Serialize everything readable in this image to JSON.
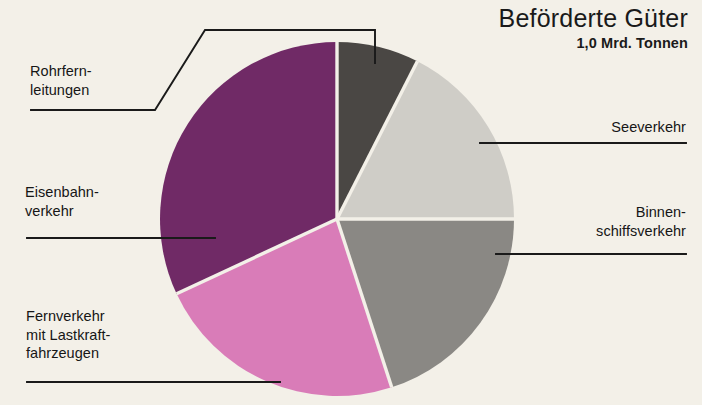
{
  "header": {
    "title": "Beförderte Güter",
    "subtitle": "1,0 Mrd. Tonnen"
  },
  "labels": {
    "rohrfernleitungen": {
      "line1": "Rohrfern-",
      "line2": "leitungen"
    },
    "eisenbahnverkehr": {
      "line1": "Eisenbahn-",
      "line2": "verkehr"
    },
    "fernverkehr": {
      "line1": "Fernverkehr",
      "line2": "mit Lastkraft-",
      "line3": "fahrzeugen"
    },
    "seeverkehr": {
      "line1": "Seeverkehr"
    },
    "binnenschiffsverkehr": {
      "line1": "Binnen-",
      "line2": "schiffsverkehr"
    }
  },
  "chart_data": {
    "type": "pie",
    "title": "Beförderte Güter",
    "subtitle": "1,0 Mrd. Tonnen",
    "unit": "Mrd. Tonnen",
    "total": 1.0,
    "legend_position": "callouts",
    "grid": false,
    "categories": [
      "Rohrfernleitungen",
      "Seeverkehr",
      "Binnenschiffsverkehr",
      "Fernverkehr mit Lastkraftfahrzeugen",
      "Eisenbahnverkehr"
    ],
    "values": [
      7.5,
      17.5,
      20.0,
      23.0,
      32.0
    ],
    "value_unit": "percent",
    "slices": [
      {
        "name": "Rohrfernleitungen",
        "percent": 7.5,
        "start_angle": 0,
        "end_angle": 27,
        "color": "#4a4744"
      },
      {
        "name": "Seeverkehr",
        "percent": 17.5,
        "start_angle": 27,
        "end_angle": 90,
        "color": "#cfcdc7"
      },
      {
        "name": "Binnenschiffsverkehr",
        "percent": 20.0,
        "start_angle": 90,
        "end_angle": 162,
        "color": "#8a8884"
      },
      {
        "name": "Fernverkehr mit Lastkraftfahrzeugen",
        "percent": 23.0,
        "start_angle": 162,
        "end_angle": 245,
        "color": "#d97cb8"
      },
      {
        "name": "Eisenbahnverkehr",
        "percent": 32.0,
        "start_angle": 245,
        "end_angle": 360,
        "color": "#702a66"
      }
    ],
    "colors": {
      "rohrfernleitungen": "#4a4744",
      "seeverkehr": "#cfcdc7",
      "binnenschiffsverkehr": "#8a8884",
      "fernverkehr": "#d97cb8",
      "eisenbahnverkehr": "#702a66",
      "background": "#f3f0e8",
      "text": "#161616",
      "separator": "#f3f0e8"
    }
  }
}
